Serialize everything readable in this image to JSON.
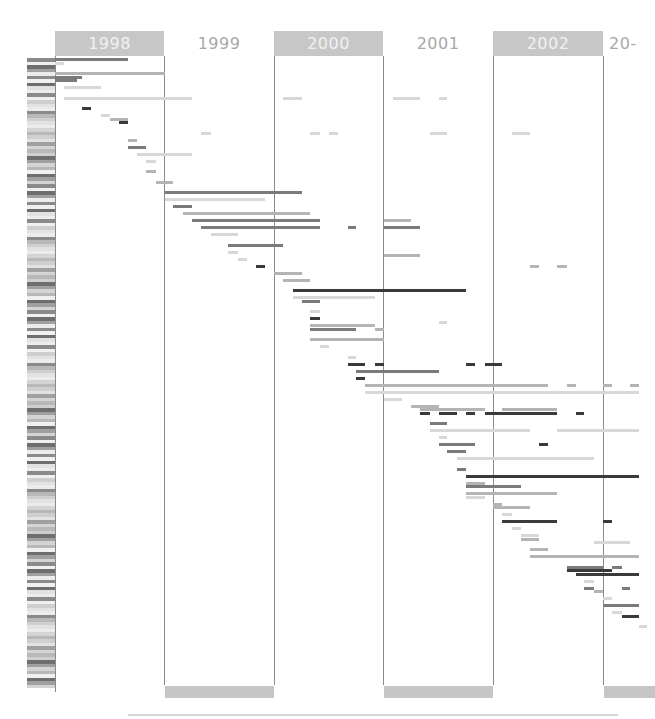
{
  "chart_data": {
    "type": "gantt",
    "title": "",
    "xlabel": "",
    "ylabel": "",
    "axis": {
      "years": [
        "1998",
        "1999",
        "2000",
        "2001",
        "2002",
        "20-"
      ],
      "shaded_years": [
        "1998",
        "2000",
        "2002"
      ],
      "x_range": [
        "1998-01",
        "2003-04"
      ]
    },
    "row_labels_note": "row labels are present along the left axis but are illegible at screenshot resolution",
    "colors": {
      "dark": "#3a3a3a",
      "mid": "#7a7a7a",
      "light": "#b4b4b4",
      "pale": "#d8d8d8",
      "header": "#c7c7c7",
      "grid": "#8a8a8a"
    },
    "series": [
      {
        "row": 0,
        "start": 1998.0,
        "end": 1998.67,
        "shade": "mid"
      },
      {
        "row": 1,
        "start": 1998.0,
        "end": 1998.08,
        "shade": "pale"
      },
      {
        "row": 4,
        "start": 1998.0,
        "end": 1999.0,
        "shade": "light"
      },
      {
        "row": 5,
        "start": 1998.0,
        "end": 1998.25,
        "shade": "mid"
      },
      {
        "row": 6,
        "start": 1998.0,
        "end": 1998.2,
        "shade": "mid"
      },
      {
        "row": 8,
        "start": 1998.08,
        "end": 1998.42,
        "shade": "pale"
      },
      {
        "row": 11,
        "start": 1998.08,
        "end": 1998.1,
        "shade": "pale"
      },
      {
        "row": 11,
        "start": 1998.1,
        "end": 1999.25,
        "shade": "pale"
      },
      {
        "row": 11,
        "start": 2000.08,
        "end": 2000.25,
        "shade": "pale"
      },
      {
        "row": 11,
        "start": 2001.08,
        "end": 2001.33,
        "shade": "pale"
      },
      {
        "row": 11,
        "start": 2001.5,
        "end": 2001.58,
        "shade": "pale"
      },
      {
        "row": 14,
        "start": 1998.25,
        "end": 1998.33,
        "shade": "dark"
      },
      {
        "row": 16,
        "start": 1998.42,
        "end": 1998.5,
        "shade": "pale"
      },
      {
        "row": 17,
        "start": 1998.5,
        "end": 1998.67,
        "shade": "light"
      },
      {
        "row": 18,
        "start": 1998.58,
        "end": 1998.67,
        "shade": "dark"
      },
      {
        "row": 21,
        "start": 1999.33,
        "end": 1999.42,
        "shade": "pale"
      },
      {
        "row": 21,
        "start": 2000.33,
        "end": 2000.42,
        "shade": "pale"
      },
      {
        "row": 21,
        "start": 2000.5,
        "end": 2000.58,
        "shade": "pale"
      },
      {
        "row": 21,
        "start": 2001.42,
        "end": 2001.58,
        "shade": "pale"
      },
      {
        "row": 21,
        "start": 2002.17,
        "end": 2002.33,
        "shade": "pale"
      },
      {
        "row": 23,
        "start": 1998.67,
        "end": 1998.75,
        "shade": "light"
      },
      {
        "row": 25,
        "start": 1998.67,
        "end": 1998.83,
        "shade": "mid"
      },
      {
        "row": 27,
        "start": 1998.75,
        "end": 1999.25,
        "shade": "pale"
      },
      {
        "row": 29,
        "start": 1998.83,
        "end": 1998.92,
        "shade": "pale"
      },
      {
        "row": 32,
        "start": 1998.83,
        "end": 1998.92,
        "shade": "light"
      },
      {
        "row": 35,
        "start": 1998.92,
        "end": 1999.08,
        "shade": "light"
      },
      {
        "row": 38,
        "start": 1999.0,
        "end": 2000.25,
        "shade": "mid"
      },
      {
        "row": 40,
        "start": 1999.0,
        "end": 1999.92,
        "shade": "pale"
      },
      {
        "row": 42,
        "start": 1999.08,
        "end": 1999.25,
        "shade": "mid"
      },
      {
        "row": 44,
        "start": 1999.17,
        "end": 2000.33,
        "shade": "light"
      },
      {
        "row": 46,
        "start": 1999.25,
        "end": 2000.42,
        "shade": "mid"
      },
      {
        "row": 46,
        "start": 2001.0,
        "end": 2001.25,
        "shade": "light"
      },
      {
        "row": 48,
        "start": 1999.33,
        "end": 2000.42,
        "shade": "mid"
      },
      {
        "row": 48,
        "start": 2000.67,
        "end": 2000.75,
        "shade": "mid"
      },
      {
        "row": 48,
        "start": 2001.0,
        "end": 2001.33,
        "shade": "mid"
      },
      {
        "row": 50,
        "start": 1999.42,
        "end": 1999.67,
        "shade": "pale"
      },
      {
        "row": 53,
        "start": 1999.58,
        "end": 2000.08,
        "shade": "mid"
      },
      {
        "row": 55,
        "start": 1999.58,
        "end": 1999.67,
        "shade": "pale"
      },
      {
        "row": 56,
        "start": 2001.0,
        "end": 2001.33,
        "shade": "light"
      },
      {
        "row": 57,
        "start": 1999.67,
        "end": 1999.75,
        "shade": "pale"
      },
      {
        "row": 59,
        "start": 1999.83,
        "end": 1999.92,
        "shade": "dark"
      },
      {
        "row": 59,
        "start": 2002.33,
        "end": 2002.42,
        "shade": "light"
      },
      {
        "row": 59,
        "start": 2002.58,
        "end": 2002.67,
        "shade": "light"
      },
      {
        "row": 61,
        "start": 2000.0,
        "end": 2000.25,
        "shade": "light"
      },
      {
        "row": 63,
        "start": 2000.08,
        "end": 2000.33,
        "shade": "light"
      },
      {
        "row": 66,
        "start": 2000.17,
        "end": 2001.75,
        "shade": "dark"
      },
      {
        "row": 68,
        "start": 2000.17,
        "end": 2000.92,
        "shade": "pale"
      },
      {
        "row": 69,
        "start": 2000.25,
        "end": 2000.42,
        "shade": "mid"
      },
      {
        "row": 72,
        "start": 2000.33,
        "end": 2000.42,
        "shade": "pale"
      },
      {
        "row": 74,
        "start": 2000.33,
        "end": 2000.42,
        "shade": "dark"
      },
      {
        "row": 75,
        "start": 2001.5,
        "end": 2001.58,
        "shade": "pale"
      },
      {
        "row": 76,
        "start": 2000.33,
        "end": 2000.92,
        "shade": "light"
      },
      {
        "row": 77,
        "start": 2000.33,
        "end": 2000.75,
        "shade": "mid"
      },
      {
        "row": 77,
        "start": 2000.92,
        "end": 2001.0,
        "shade": "light"
      },
      {
        "row": 80,
        "start": 2000.33,
        "end": 2001.0,
        "shade": "light"
      },
      {
        "row": 82,
        "start": 2000.42,
        "end": 2000.5,
        "shade": "pale"
      },
      {
        "row": 85,
        "start": 2000.67,
        "end": 2000.75,
        "shade": "pale"
      },
      {
        "row": 87,
        "start": 2000.67,
        "end": 2000.83,
        "shade": "dark"
      },
      {
        "row": 87,
        "start": 2000.92,
        "end": 2001.0,
        "shade": "dark"
      },
      {
        "row": 87,
        "start": 2001.75,
        "end": 2001.83,
        "shade": "dark"
      },
      {
        "row": 87,
        "start": 2001.92,
        "end": 2002.08,
        "shade": "dark"
      },
      {
        "row": 89,
        "start": 2000.75,
        "end": 2001.0,
        "shade": "mid"
      },
      {
        "row": 89,
        "start": 2001.0,
        "end": 2001.5,
        "shade": "mid"
      },
      {
        "row": 91,
        "start": 2000.75,
        "end": 2000.83,
        "shade": "dark"
      },
      {
        "row": 93,
        "start": 2000.83,
        "end": 2002.5,
        "shade": "light"
      },
      {
        "row": 93,
        "start": 2002.67,
        "end": 2002.75,
        "shade": "light"
      },
      {
        "row": 93,
        "start": 2003.0,
        "end": 2003.08,
        "shade": "light"
      },
      {
        "row": 93,
        "start": 2003.25,
        "end": 2003.33,
        "shade": "light"
      },
      {
        "row": 95,
        "start": 2000.83,
        "end": 2003.33,
        "shade": "pale"
      },
      {
        "row": 97,
        "start": 2001.0,
        "end": 2001.17,
        "shade": "pale"
      },
      {
        "row": 99,
        "start": 2001.25,
        "end": 2001.5,
        "shade": "light"
      },
      {
        "row": 100,
        "start": 2001.33,
        "end": 2001.92,
        "shade": "light"
      },
      {
        "row": 100,
        "start": 2002.08,
        "end": 2002.58,
        "shade": "light"
      },
      {
        "row": 101,
        "start": 2001.33,
        "end": 2001.42,
        "shade": "dark"
      },
      {
        "row": 101,
        "start": 2001.5,
        "end": 2001.67,
        "shade": "dark"
      },
      {
        "row": 101,
        "start": 2001.75,
        "end": 2001.83,
        "shade": "dark"
      },
      {
        "row": 101,
        "start": 2001.92,
        "end": 2002.58,
        "shade": "dark"
      },
      {
        "row": 101,
        "start": 2002.75,
        "end": 2002.83,
        "shade": "dark"
      },
      {
        "row": 104,
        "start": 2001.42,
        "end": 2001.58,
        "shade": "mid"
      },
      {
        "row": 106,
        "start": 2001.42,
        "end": 2002.33,
        "shade": "pale"
      },
      {
        "row": 106,
        "start": 2002.58,
        "end": 2003.33,
        "shade": "pale"
      },
      {
        "row": 108,
        "start": 2001.5,
        "end": 2001.58,
        "shade": "pale"
      },
      {
        "row": 110,
        "start": 2001.5,
        "end": 2001.83,
        "shade": "mid"
      },
      {
        "row": 110,
        "start": 2002.42,
        "end": 2002.5,
        "shade": "dark"
      },
      {
        "row": 112,
        "start": 2001.58,
        "end": 2001.75,
        "shade": "mid"
      },
      {
        "row": 114,
        "start": 2001.67,
        "end": 2002.92,
        "shade": "pale"
      },
      {
        "row": 117,
        "start": 2001.67,
        "end": 2001.75,
        "shade": "mid"
      },
      {
        "row": 119,
        "start": 2001.75,
        "end": 2003.33,
        "shade": "dark"
      },
      {
        "row": 121,
        "start": 2001.75,
        "end": 2001.92,
        "shade": "light"
      },
      {
        "row": 122,
        "start": 2001.75,
        "end": 2002.25,
        "shade": "mid"
      },
      {
        "row": 124,
        "start": 2001.75,
        "end": 2002.58,
        "shade": "light"
      },
      {
        "row": 125,
        "start": 2001.75,
        "end": 2001.92,
        "shade": "pale"
      },
      {
        "row": 127,
        "start": 2002.0,
        "end": 2002.08,
        "shade": "light"
      },
      {
        "row": 128,
        "start": 2002.0,
        "end": 2002.33,
        "shade": "light"
      },
      {
        "row": 130,
        "start": 2002.08,
        "end": 2002.17,
        "shade": "pale"
      },
      {
        "row": 132,
        "start": 2002.08,
        "end": 2002.58,
        "shade": "dark"
      },
      {
        "row": 132,
        "start": 2003.0,
        "end": 2003.08,
        "shade": "dark"
      },
      {
        "row": 134,
        "start": 2002.17,
        "end": 2002.25,
        "shade": "pale"
      },
      {
        "row": 136,
        "start": 2002.25,
        "end": 2002.42,
        "shade": "pale"
      },
      {
        "row": 137,
        "start": 2002.25,
        "end": 2002.42,
        "shade": "light"
      },
      {
        "row": 138,
        "start": 2002.92,
        "end": 2003.25,
        "shade": "pale"
      },
      {
        "row": 140,
        "start": 2002.33,
        "end": 2002.5,
        "shade": "light"
      },
      {
        "row": 142,
        "start": 2002.33,
        "end": 2003.33,
        "shade": "light"
      },
      {
        "row": 145,
        "start": 2002.67,
        "end": 2003.0,
        "shade": "mid"
      },
      {
        "row": 145,
        "start": 2003.08,
        "end": 2003.17,
        "shade": "mid"
      },
      {
        "row": 146,
        "start": 2002.67,
        "end": 2003.08,
        "shade": "dark"
      },
      {
        "row": 147,
        "start": 2002.75,
        "end": 2003.33,
        "shade": "dark"
      },
      {
        "row": 149,
        "start": 2002.83,
        "end": 2002.92,
        "shade": "pale"
      },
      {
        "row": 151,
        "start": 2002.83,
        "end": 2002.92,
        "shade": "mid"
      },
      {
        "row": 151,
        "start": 2003.17,
        "end": 2003.25,
        "shade": "mid"
      },
      {
        "row": 152,
        "start": 2002.92,
        "end": 2003.0,
        "shade": "light"
      },
      {
        "row": 154,
        "start": 2003.0,
        "end": 2003.08,
        "shade": "pale"
      },
      {
        "row": 156,
        "start": 2003.0,
        "end": 2003.33,
        "shade": "mid"
      },
      {
        "row": 158,
        "start": 2003.08,
        "end": 2003.17,
        "shade": "pale"
      },
      {
        "row": 159,
        "start": 2003.17,
        "end": 2003.33,
        "shade": "dark"
      },
      {
        "row": 162,
        "start": 2003.33,
        "end": 2003.4,
        "shade": "pale"
      }
    ]
  }
}
